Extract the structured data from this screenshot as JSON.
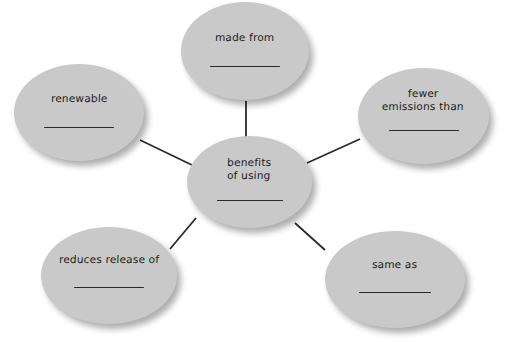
{
  "diagram": {
    "type": "concept-map",
    "title": "benefits of using",
    "colors": {
      "node_fill": "#c9c9c9",
      "text": "#1a1a1a",
      "connector": "#2b2b2b",
      "background": "#ffffff"
    },
    "center": {
      "id": "benefits",
      "label": "benefits\nof using",
      "has_blank": true
    },
    "nodes": [
      {
        "id": "made-from",
        "label": "made from",
        "has_blank": true
      },
      {
        "id": "renewable",
        "label": "renewable",
        "has_blank": true
      },
      {
        "id": "fewer-emissions",
        "label": "fewer\nemissions than",
        "has_blank": true
      },
      {
        "id": "reduces",
        "label": "reduces release of",
        "has_blank": true
      },
      {
        "id": "same-as",
        "label": "same as",
        "has_blank": true
      }
    ],
    "connectors": [
      {
        "from": "benefits",
        "to": "made-from",
        "x1": 246,
        "y1": 137,
        "x2": 246,
        "y2": 101
      },
      {
        "from": "benefits",
        "to": "renewable",
        "x1": 194,
        "y1": 166,
        "x2": 140,
        "y2": 140
      },
      {
        "from": "benefits",
        "to": "fewer-emissions",
        "x1": 307,
        "y1": 163,
        "x2": 360,
        "y2": 139
      },
      {
        "from": "benefits",
        "to": "reduces",
        "x1": 196,
        "y1": 218,
        "x2": 170,
        "y2": 249
      },
      {
        "from": "benefits",
        "to": "same-as",
        "x1": 295,
        "y1": 223,
        "x2": 325,
        "y2": 250
      }
    ]
  }
}
